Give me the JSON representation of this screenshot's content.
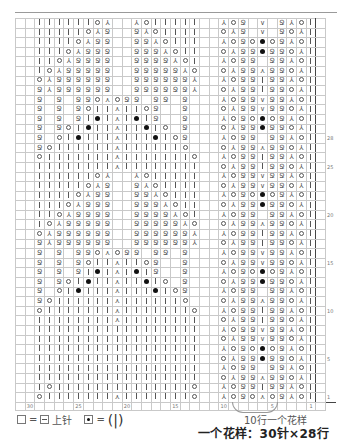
{
  "legend": {
    "blank_equals": "=",
    "purl_label": "上针",
    "dot_equals": "=",
    "bobble_glyph": "(|)"
  },
  "captions": {
    "repeat_note": "10行一个花样",
    "pattern_size": "一个花样：30针×28行"
  },
  "grid": {
    "columns": 32,
    "column_labels": {
      "1": "1",
      "5": "5",
      "10": "10",
      "15": "15",
      "20": "20",
      "25": "25",
      "30": "30"
    },
    "row_labels": {
      "1": "1",
      "5": "5",
      "10": "10",
      "15": "15",
      "20": "20",
      "25": "25",
      "28": "28"
    },
    "symbols": {
      "K": "knit",
      "O": "yarn-over",
      "L": "k2tog",
      "R": "ssk",
      "Q": "twisted-knit",
      "D": "bobble",
      "A": "double-decrease",
      "V": "cable-v",
      "P": "purl-blank"
    },
    "rows": [
      "PPKKKKKKOLPPROKKKKKPPROQPVPQROKP",
      "PPKKKKKOLQPPQROKKKKPPOLQPVPQOLKP",
      "PPKKKKOLQQPPQQROKKKPPROQODOQROKP",
      "PPKKKOLQQQPPQQQROKKPPOLQQDQQOLKP",
      "PPKKOLQQQQPPQQQQROKPPROQQPQQROKP",
      "PPKOLQQQQQPPQQQQQROPPOLQQAQQOLKP",
      "PPOLQQQQQQPPQQQQQQRPPROQQKQQROKP",
      "PPQRQQQQQQPPQQQQQQLPPOLQQKQQOLKP",
      "PPQPQPQQOAOQQPQQPQPPPROQQVQQROKP",
      "PPQPQPQOKKAKKOQPPQPPPOLQQVQQOLKP",
      "PPQPQPQKDKAKDKQPPQPPPROQODOQROKP",
      "PPQPQOKDKKAKKDKOPQPPPOLQQDQQOLKP",
      "PPQPOKDKKKAKKKDKOQPPPROQQPQQROKP",
      "PPQOKKKKKKAKKKKKKOPPPOLQQAQQOLKP",
      "PPOKKKKKKKAKKKKKKKOPPROQQKQQROKP",
      "PPKKKKKKKKAKKKKKKKKPPOLQQKQQOLKP",
      "PPKKKKKKOLPPROKKKKKPPROQQVQQROKP",
      "PPKKKKKOLQPPQROKKKKPPOLQQVQQOLKP",
      "PPKKKKOLQQPPQQROKKKPPROQODOQROKP",
      "PPKKKOLQQQPPQQQROKKPPOLQQDQQOLKP",
      "PPKKOLQQQQPPQQQQROKPPROQQPQQROKP",
      "PPKOLQQQQQPPQQQQQROPPOLQQAQQOLKP",
      "PPOLQQQQQQPPQQQQQQRPPROQQKQQROKP",
      "PPQRQQQQQQPPQQQQQQLPPOLQQKQQOLKP",
      "PPQPQPQQOAOQQPQQPQPPPROQQVQQROKP",
      "PPQPQPQOKKAKKOQPPQPPPOLQQVQQOLKP",
      "PPQPQPQKDKAKDKQPPQPPPROQODOQROKP",
      "PPQPQOKDKKAKKDKOPQPPPOLQQDQQOLKP",
      "PPQPOKDKKKAKKKDKOQPPPROQQPQQROKP",
      "PPQOKKKKKKAKKKKKKOPPPOLQQAQQOLKP",
      "PPOKKKKKKKAKKKKKKKOPPROQQKQQROKP",
      "PPKKKKKKKKAKKKKKKKKPPOLQQKQQOLKP",
      "PPKKKKKKKKKKKKKKKKKPPROQQVQQROKP",
      "PPKKKKKKKKKKKKKKKKKPPOLQQVQQOLKP",
      "PPKKKKKKKKKKKKKKKKKPPROQODOQROKP",
      "PPKKKKKKKKKKKKKKKKKPPOLQQDQQOLKP",
      "PPKKKKKKKKKKKKKKKKKPPROQQPQQROKP",
      "PPKKKKKKKKKKKKKKKKKPPOLQQAQQOLKP",
      "PPKOKKKKKKKKKKKKKKOPPROQQKQQROKP",
      "PPOKKKKKKKAKKKKKKKOPPROQOAOQROKP"
    ]
  }
}
